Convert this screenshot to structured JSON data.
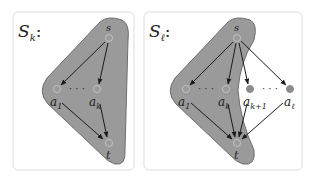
{
  "panels": [
    {
      "id": "left",
      "title": "S",
      "title_sub": "k",
      "nodes": {
        "s": "s",
        "a1": "a",
        "a1_sub": "1",
        "ak": "a",
        "ak_sub": "k",
        "t": "t"
      },
      "ellipsis": "· · ·"
    },
    {
      "id": "right",
      "title": "S",
      "title_sub": "ℓ",
      "nodes": {
        "s": "s",
        "a1": "a",
        "a1_sub": "1",
        "ak": "a",
        "ak_sub": "k",
        "ak1": "a",
        "ak1_sub": "k+1",
        "al": "a",
        "al_sub": "ℓ",
        "t": "t"
      },
      "ellipsis_left": "· · ·",
      "ellipsis_right": "· · ·"
    }
  ],
  "colors": {
    "region_fill": "#9a9a9a",
    "region_stroke": "#6e6e6e",
    "panel_border": "#dddddd",
    "open_node_stroke": "#bfbfbf",
    "filled_node": "#8c8c8c",
    "edge": "#1a1a1a"
  }
}
